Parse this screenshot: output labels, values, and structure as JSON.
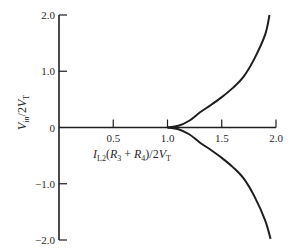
{
  "chart_data": {
    "type": "line",
    "title": "",
    "xlabel": "I_L2(R_3 + R_4)/2V_T",
    "ylabel": "V_in/2V_T",
    "xlim": [
      0,
      2.0
    ],
    "ylim": [
      -2.0,
      2.0
    ],
    "grid": false,
    "legend": "none",
    "x_ticks": [
      {
        "value": 0.5,
        "label": "0.5"
      },
      {
        "value": 1.0,
        "label": "1.0"
      },
      {
        "value": 1.5,
        "label": "1.5"
      },
      {
        "value": 2.0,
        "label": "2.0"
      }
    ],
    "y_ticks": [
      {
        "value": 2.0,
        "label": "2.0"
      },
      {
        "value": 1.0,
        "label": "1.0"
      },
      {
        "value": 0,
        "label": "0"
      },
      {
        "value": -1.0,
        "label": "−1.0"
      },
      {
        "value": -2.0,
        "label": "−2.0"
      }
    ],
    "series": [
      {
        "name": "zero-branch",
        "x": [
          0,
          0.5,
          1.0,
          1.5,
          2.0
        ],
        "y": [
          0,
          0,
          0,
          0,
          0
        ]
      },
      {
        "name": "upper-branch",
        "x": [
          1.0,
          1.1,
          1.2,
          1.3,
          1.4,
          1.5,
          1.6,
          1.7,
          1.8,
          1.9,
          1.94
        ],
        "y": [
          0,
          0.03,
          0.12,
          0.27,
          0.4,
          0.54,
          0.7,
          0.9,
          1.22,
          1.65,
          2.0
        ]
      },
      {
        "name": "lower-branch",
        "x": [
          1.0,
          1.1,
          1.2,
          1.3,
          1.4,
          1.5,
          1.6,
          1.7,
          1.8,
          1.9,
          1.95
        ],
        "y": [
          0,
          -0.03,
          -0.12,
          -0.27,
          -0.4,
          -0.54,
          -0.7,
          -0.9,
          -1.22,
          -1.65,
          -1.98
        ]
      }
    ]
  }
}
